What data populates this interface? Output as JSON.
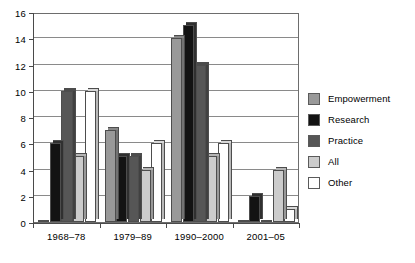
{
  "chart_data": {
    "type": "bar",
    "title": "",
    "xlabel": "",
    "ylabel": "",
    "ylim": [
      0,
      16
    ],
    "ytick_step": 2,
    "yticks": [
      0,
      2,
      4,
      6,
      8,
      10,
      12,
      14,
      16
    ],
    "grid": true,
    "legend_position": "right",
    "categories": [
      "1968–78",
      "1979–89",
      "1990–2000",
      "2001–05"
    ],
    "series": [
      {
        "name": "Empowerment",
        "color": "#999999",
        "values": [
          0,
          7,
          14,
          0
        ]
      },
      {
        "name": "Research",
        "color": "#131313",
        "values": [
          6,
          5,
          15,
          2
        ]
      },
      {
        "name": "Practice",
        "color": "#565656",
        "values": [
          10,
          5,
          12,
          0
        ]
      },
      {
        "name": "All",
        "color": "#cccccc",
        "values": [
          5,
          4,
          5,
          4
        ]
      },
      {
        "name": "Other",
        "color": "#ffffff",
        "values": [
          10,
          6,
          6,
          1
        ]
      }
    ]
  },
  "legend": {
    "items": [
      {
        "label": "Empowerment"
      },
      {
        "label": "Research"
      },
      {
        "label": "Practice"
      },
      {
        "label": "All"
      },
      {
        "label": "Other"
      }
    ]
  }
}
